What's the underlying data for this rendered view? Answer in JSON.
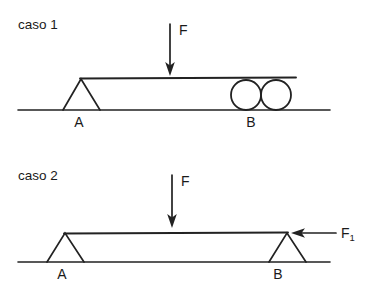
{
  "figure": {
    "stroke_color": "#222222",
    "text_color": "#1a1a1a",
    "background_color": "#ffffff"
  },
  "cases": [
    {
      "id": "caso-1",
      "label": "caso 1",
      "support_left": {
        "type": "triangle-pin",
        "label": "A"
      },
      "support_right": {
        "type": "double-roller",
        "label": "B",
        "roller_count": 2
      },
      "forces": [
        {
          "id": "F",
          "label": "F",
          "direction": "down"
        }
      ]
    },
    {
      "id": "caso-2",
      "label": "caso 2",
      "support_left": {
        "type": "triangle-pin",
        "label": "A"
      },
      "support_right": {
        "type": "triangle-pin",
        "label": "B"
      },
      "forces": [
        {
          "id": "F",
          "label": "F",
          "direction": "down"
        },
        {
          "id": "F1",
          "label": "F",
          "subscript": "1",
          "direction": "left"
        }
      ]
    }
  ],
  "geometry": {
    "case1": {
      "ground_y": 110,
      "ground_x1": 18,
      "ground_x2": 330,
      "beam_y": 78,
      "beam_x1": 80,
      "beam_x2": 296,
      "tri_apex_x": 81,
      "tri_base_left": 63,
      "tri_base_right": 100,
      "roller_radius": 15,
      "roller1_cx": 246,
      "roller2_cx": 276,
      "roller_cy": 95,
      "force_x": 170,
      "force_y1": 24,
      "force_y2": 72,
      "label_a_x": 79,
      "label_b_x": 251,
      "label_y": 127
    },
    "case2": {
      "ground_y": 262,
      "ground_x1": 18,
      "ground_x2": 330,
      "beam_y": 233,
      "beam_x1": 64,
      "beam_x2": 288,
      "tri_a_apex_x": 65,
      "tri_a_base_left": 47,
      "tri_a_base_right": 84,
      "tri_b_apex_x": 287,
      "tri_b_base_left": 269,
      "tri_b_base_right": 306,
      "force_x": 172,
      "force_y1": 175,
      "force_y2": 224,
      "f1_arrow_x_tip": 292,
      "f1_arrow_x_tail": 336,
      "f1_arrow_y": 233,
      "label_a_x": 62,
      "label_b_x": 278,
      "label_y": 279,
      "label_f1_x": 341
    }
  }
}
